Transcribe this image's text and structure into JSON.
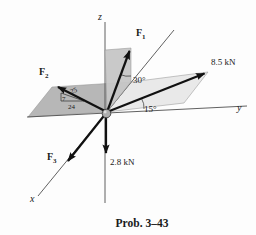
{
  "figure": {
    "caption": "Prob. 3–43",
    "axes": {
      "x": "x",
      "y": "y",
      "z": "z"
    },
    "forces": {
      "f1": {
        "symbol": "F",
        "subscript": "1"
      },
      "f2": {
        "symbol": "F",
        "subscript": "2"
      },
      "f3": {
        "symbol": "F",
        "subscript": "3"
      },
      "force_85": "8.5 kN",
      "force_28": "2.8 kN"
    },
    "angles": {
      "from_vertical": "30°",
      "from_y_axis": "15°"
    },
    "slope_triangle": {
      "hypotenuse": "25",
      "vertical_leg": "7",
      "horizontal_leg": "24"
    },
    "colors": {
      "caption": "#6b2727",
      "plane_left": "#b7b7b7",
      "plane_right": "#e9e9e9",
      "plane_vertical": "#c6c6c6",
      "ink": "#111111"
    }
  }
}
